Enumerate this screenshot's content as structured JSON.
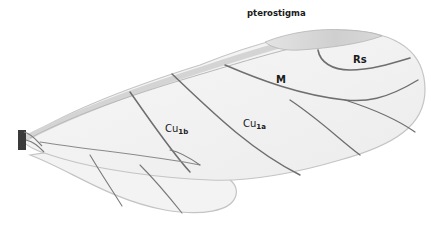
{
  "figure": {
    "labels": {
      "pterostigma": "pterostigma",
      "rs": "Rs",
      "m": "M",
      "cu1b": {
        "base": "Cu",
        "sub": "1b"
      },
      "cu1a": {
        "base": "Cu",
        "sub": "1a"
      }
    },
    "colors": {
      "background": "#ffffff",
      "membrane": "#f1f1f1",
      "membrane_edge": "#c8c8c8",
      "pterostigma": "#d0d0d0",
      "vein": "#6e6e6e",
      "wing_base": "#3a3a3a",
      "label_text": "#1a1a1a"
    }
  }
}
